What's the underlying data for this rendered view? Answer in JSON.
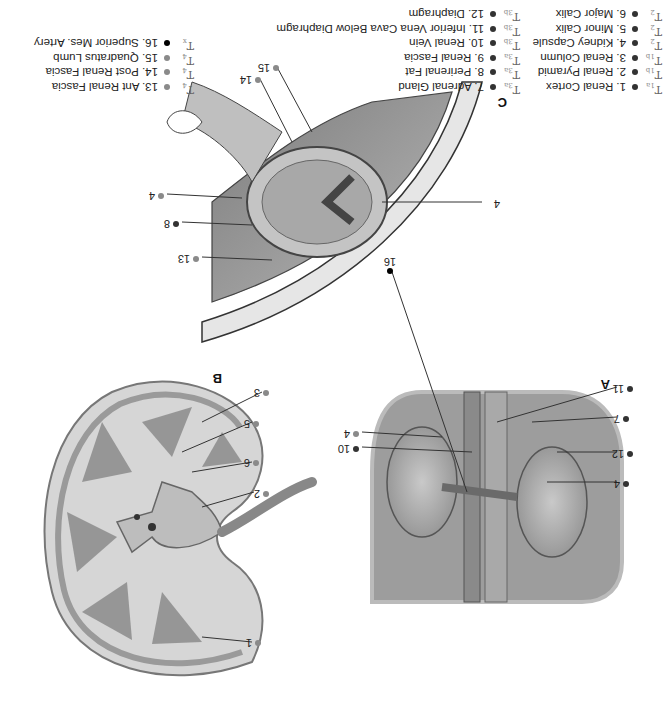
{
  "panels": {
    "a": {
      "label": "A"
    },
    "b": {
      "label": "B"
    },
    "c": {
      "label": "C"
    }
  },
  "legend": [
    {
      "num": "1. Renal Cortex",
      "tcode": "T",
      "tsub": "1a",
      "dot": "dark"
    },
    {
      "num": "2. Renal Pyramid",
      "tcode": "T",
      "tsub": "1b",
      "dot": "dark"
    },
    {
      "num": "3. Renal Column",
      "tcode": "T",
      "tsub": "1b",
      "dot": "dark"
    },
    {
      "num": "4. Kidney Capsule",
      "tcode": "T",
      "tsub": "2",
      "dot": "dark"
    },
    {
      "num": "5. Minor Calix",
      "tcode": "T",
      "tsub": "2",
      "dot": "dark"
    },
    {
      "num": "6. Major Calix",
      "tcode": "T",
      "tsub": "2",
      "dot": "dark"
    },
    {
      "num": "7. Adrenal Gland",
      "tcode": "T",
      "tsub": "3a",
      "dot": "dark"
    },
    {
      "num": "8. Perirenal Fat",
      "tcode": "T",
      "tsub": "3a",
      "dot": "dark"
    },
    {
      "num": "9. Renal Fascia",
      "tcode": "T",
      "tsub": "3a",
      "dot": "dark"
    },
    {
      "num": "10. Renal Vein",
      "tcode": "T",
      "tsub": "3b",
      "dot": "dark"
    },
    {
      "num": "11. Inferior Vena Cava Below Diaphragm",
      "tcode": "T",
      "tsub": "3b",
      "dot": "dark"
    },
    {
      "num": "12. Diaphragm",
      "tcode": "T",
      "tsub": "3b",
      "dot": "dark"
    },
    {
      "num": "13. Ant Renal Fascia",
      "tcode": "T",
      "tsub": "4",
      "dot": "gray"
    },
    {
      "num": "14. Post Renal Fascia",
      "tcode": "T",
      "tsub": "4",
      "dot": "gray"
    },
    {
      "num": "15. Quadratus Lumb",
      "tcode": "T",
      "tsub": "4",
      "dot": "gray"
    },
    {
      "num": "16. Superior Mes. Artery",
      "tcode": "T",
      "tsub": "x",
      "dot": "black"
    }
  ],
  "callouts": {
    "a": [
      "4",
      "12",
      "7",
      "11",
      "16",
      "4",
      "10"
    ],
    "b": [
      "1",
      "2",
      "6",
      "5",
      "3"
    ],
    "c": [
      "4",
      "13",
      "8",
      "4",
      "14",
      "15"
    ]
  }
}
